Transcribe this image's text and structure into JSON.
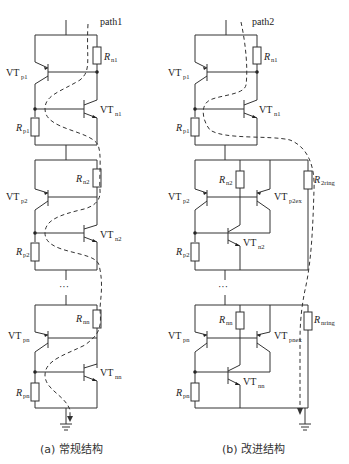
{
  "figure": {
    "left": {
      "caption": "(a) 常规结构",
      "path_label": "path1",
      "stages": [
        {
          "VTp": "VT",
          "VTp_sub": "p1",
          "VTn": "VT",
          "VTn_sub": "n1",
          "Rp": "R",
          "Rp_sub": "p1",
          "Rn": "R",
          "Rn_sub": "n1"
        },
        {
          "VTp": "VT",
          "VTp_sub": "p2",
          "VTn": "VT",
          "VTn_sub": "n2",
          "Rp": "R",
          "Rp_sub": "p2",
          "Rn": "R",
          "Rn_sub": "n2"
        },
        {
          "VTp": "VT",
          "VTp_sub": "pn",
          "VTn": "VT",
          "VTn_sub": "nn",
          "Rp": "R",
          "Rp_sub": "pn",
          "Rn": "R",
          "Rn_sub": "nn"
        }
      ],
      "ellipsis": "···"
    },
    "right": {
      "caption": "(b) 改进结构",
      "path_label": "path2",
      "stages": [
        {
          "VTp": "VT",
          "VTp_sub": "p1",
          "VTn": "VT",
          "VTn_sub": "n1",
          "Rp": "R",
          "Rp_sub": "p1",
          "Rn": "R",
          "Rn_sub": "n1"
        },
        {
          "VTp": "VT",
          "VTp_sub": "p2",
          "VTpex": "VT",
          "VTpex_sub": "p2ex",
          "VTn": "VT",
          "VTn_sub": "n2",
          "Rp": "R",
          "Rp_sub": "p2",
          "Rn": "R",
          "Rn_sub": "n2",
          "Rring": "R",
          "Rring_sub": "2ring"
        },
        {
          "VTp": "VT",
          "VTp_sub": "pn",
          "VTpex": "VT",
          "VTpex_sub": "pnex",
          "VTn": "VT",
          "VTn_sub": "nn",
          "Rp": "R",
          "Rp_sub": "pn",
          "Rn": "R",
          "Rn_sub": "nn",
          "Rring": "R",
          "Rring_sub": "nring"
        }
      ],
      "ellipsis": "···"
    }
  }
}
